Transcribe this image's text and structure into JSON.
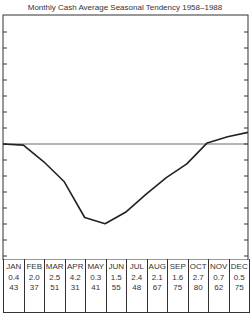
{
  "header": {
    "title": "WHEAT",
    "subtitle": "Monthly Cash Average Seasonal Tendency 1958–1988"
  },
  "chart_data": {
    "type": "line",
    "title": "Monthly Cash Average Seasonal Tendency 1958–1988",
    "xlabel": "",
    "ylabel": "",
    "categories": [
      "JAN",
      "FEB",
      "MAR",
      "APR",
      "MAY",
      "JUN",
      "JUL",
      "AUG",
      "SEP",
      "OCT",
      "NOV",
      "DEC"
    ],
    "series": [
      {
        "name": "Seasonal tendency (relative, px-estimated, 0 = baseline)",
        "values": [
          -0.1,
          -1.7,
          -3.6,
          -7.0,
          -7.6,
          -6.5,
          -4.8,
          -3.2,
          -1.9,
          0.1,
          0.7,
          1.1
        ]
      }
    ],
    "grid": false,
    "zero_line": true,
    "table_rows": {
      "month": [
        "JAN",
        "FEB",
        "MAR",
        "APR",
        "MAY",
        "JUN",
        "JUL",
        "AUG",
        "SEP",
        "OCT",
        "NOV",
        "DEC"
      ],
      "row1": [
        "0.4",
        "2.0",
        "2.5",
        "4.2",
        "0.3",
        "1.5",
        "2.4",
        "2.1",
        "1.6",
        "2.7",
        "0.7",
        "0.5"
      ],
      "row2": [
        "43",
        "37",
        "51",
        "31",
        "41",
        "55",
        "48",
        "67",
        "75",
        "80",
        "62",
        "75"
      ]
    }
  }
}
